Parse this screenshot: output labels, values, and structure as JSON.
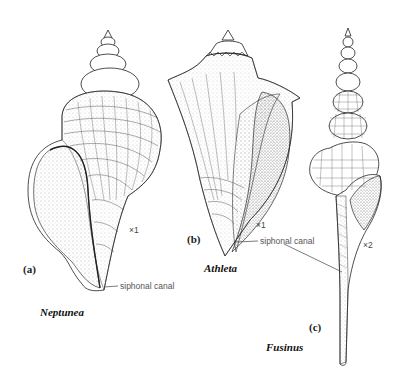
{
  "figure": {
    "panels": [
      {
        "id": "a",
        "panel_label": "(a)",
        "genus": "Neptunea",
        "scale": "×1",
        "callout": "siphonal canal"
      },
      {
        "id": "b",
        "panel_label": "(b)",
        "genus": "Athleta",
        "scale": "×1",
        "callout": "siphonal canal"
      },
      {
        "id": "c",
        "panel_label": "(c)",
        "genus": "Fusinus",
        "scale": "×2"
      }
    ],
    "colors": {
      "ink": "#222222",
      "stipple": "#555555",
      "background": "#ffffff"
    }
  }
}
